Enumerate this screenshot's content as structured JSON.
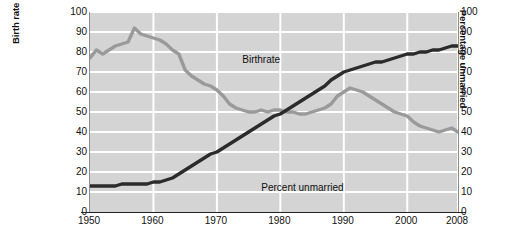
{
  "chart_data": {
    "type": "line",
    "title": "",
    "xlabel": "",
    "ylabel": "Birth rate per 1,000 15- to 19-year-old U.S. girls",
    "ylabel_right": "Percentage unmarried",
    "xlim": [
      1950,
      2008
    ],
    "ylim": [
      0,
      100
    ],
    "ylim_right": [
      0,
      100
    ],
    "grid": true,
    "legend_position": "inline-annotation",
    "x_tick_labels": [
      "1950",
      "1960",
      "1970",
      "1980",
      "1990",
      "2000",
      "2008"
    ],
    "x_ticks": [
      1950,
      1960,
      1970,
      1980,
      1990,
      2000,
      2008
    ],
    "y_tick_labels": [
      "0",
      "10",
      "20",
      "30",
      "40",
      "50",
      "60",
      "70",
      "80",
      "90",
      "100"
    ],
    "y_ticks": [
      0,
      10,
      20,
      30,
      40,
      50,
      60,
      70,
      80,
      90,
      100
    ],
    "y_tick_labels_right": [
      "0",
      "10",
      "20",
      "30",
      "40",
      "50",
      "60",
      "70",
      "80",
      "90",
      "100"
    ],
    "y_ticks_right": [
      0,
      10,
      20,
      30,
      40,
      50,
      60,
      70,
      80,
      90,
      100
    ],
    "series": [
      {
        "name": "Birthrate",
        "color": "#9a9a9a",
        "axis": "left",
        "x": [
          1950,
          1951,
          1952,
          1953,
          1954,
          1955,
          1956,
          1957,
          1958,
          1959,
          1960,
          1961,
          1962,
          1963,
          1964,
          1965,
          1966,
          1967,
          1968,
          1969,
          1970,
          1971,
          1972,
          1973,
          1974,
          1975,
          1976,
          1977,
          1978,
          1979,
          1980,
          1981,
          1982,
          1983,
          1984,
          1985,
          1986,
          1987,
          1988,
          1989,
          1990,
          1991,
          1992,
          1993,
          1994,
          1995,
          1996,
          1997,
          1998,
          1999,
          2000,
          2001,
          2002,
          2003,
          2004,
          2005,
          2006,
          2007,
          2008
        ],
        "values": [
          77,
          81,
          79,
          81,
          83,
          84,
          85,
          92,
          89,
          88,
          87,
          86,
          84,
          81,
          79,
          71,
          68,
          66,
          64,
          63,
          61,
          58,
          54,
          52,
          51,
          50,
          50,
          51,
          50,
          51,
          51,
          50,
          50,
          49,
          49,
          50,
          51,
          52,
          54,
          58,
          60,
          62,
          61,
          60,
          58,
          56,
          54,
          52,
          50,
          49,
          48,
          45,
          43,
          42,
          41,
          40,
          41,
          42,
          40
        ]
      },
      {
        "name": "Percent unmarried",
        "color": "#2b2b2b",
        "axis": "right",
        "x": [
          1950,
          1951,
          1952,
          1953,
          1954,
          1955,
          1956,
          1957,
          1958,
          1959,
          1960,
          1961,
          1962,
          1963,
          1964,
          1965,
          1966,
          1967,
          1968,
          1969,
          1970,
          1971,
          1972,
          1973,
          1974,
          1975,
          1976,
          1977,
          1978,
          1979,
          1980,
          1981,
          1982,
          1983,
          1984,
          1985,
          1986,
          1987,
          1988,
          1989,
          1990,
          1991,
          1992,
          1993,
          1994,
          1995,
          1996,
          1997,
          1998,
          1999,
          2000,
          2001,
          2002,
          2003,
          2004,
          2005,
          2006,
          2007,
          2008
        ],
        "values": [
          13,
          13,
          13,
          13,
          13,
          14,
          14,
          14,
          14,
          14,
          15,
          15,
          16,
          17,
          19,
          21,
          23,
          25,
          27,
          29,
          30,
          32,
          34,
          36,
          38,
          40,
          42,
          44,
          46,
          48,
          49,
          51,
          53,
          55,
          57,
          59,
          61,
          63,
          66,
          68,
          70,
          71,
          72,
          73,
          74,
          75,
          75,
          76,
          77,
          78,
          79,
          79,
          80,
          80,
          81,
          81,
          82,
          83,
          83
        ]
      }
    ],
    "annotations": [
      {
        "text": "Birthrate",
        "x": 1974,
        "y": 76
      },
      {
        "text": "Percent unmarried",
        "x": 1977,
        "y": 12
      }
    ]
  }
}
